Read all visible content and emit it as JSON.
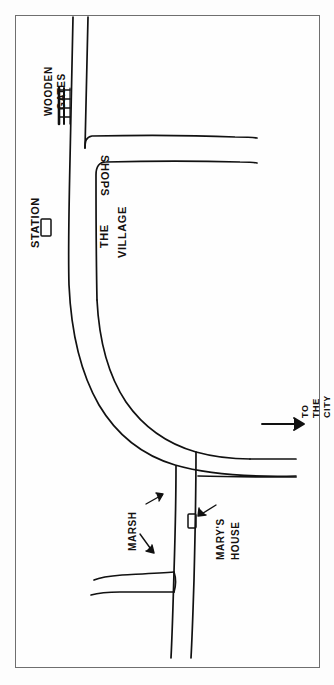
{
  "document": {
    "type": "hand-drawn-sketch-map",
    "title": "Hand-drawn directions map",
    "orientation": "portrait",
    "width": 334,
    "height": 685,
    "paper_color": "#fdfdfd",
    "ink_color": "#111111",
    "frame_color": "#6f6f6f",
    "note": "All text is hand-lettered in capitals and rotated sideways; the sheet reads as a map turned 90 degrees."
  },
  "labels": {
    "wooden_gates": {
      "line1": "WOODEN",
      "line2": "GATES",
      "rotation": "-90",
      "refers_to": "gate-bar across the northern road"
    },
    "station": {
      "text": "STATION",
      "rotation": "-90",
      "refers_to": "small rectangle building west of the road"
    },
    "shops": {
      "text": "SHOPS",
      "rotation": "90",
      "refers_to": "row of shops on the village street"
    },
    "the_village": {
      "line1": "THE",
      "line2": "VILLAGE",
      "rotation": "-90",
      "refers_to": "village area enclosed by the roads"
    },
    "to_the_city": {
      "line1": "TO",
      "line2": "THE",
      "line3": "CITY",
      "rotation": "-90",
      "refers_to": "eastbound road leaving the map, marked with an arrow"
    },
    "marsh": {
      "text": "MARSH",
      "rotation": "-90",
      "arrow_count": 2,
      "refers_to": "boggy ground either side of the southern lane"
    },
    "marys_house": {
      "line1": "MARY'S",
      "line2": "HOUSE",
      "rotation": "-90",
      "arrow_count": 1,
      "refers_to": "small rectangle building beside the southern lane"
    }
  },
  "symbols": {
    "station_building": "rectangle-outline",
    "marys_house_building": "rectangle-outline",
    "gate_bar": "thick-hatched-bar",
    "direction_arrow": "arrow-right",
    "pointer_arrows": "arrow-head-line"
  },
  "map_features": [
    {
      "id": "north-road",
      "name": "North road (to the gates)",
      "kind": "double-line road"
    },
    {
      "id": "village-street",
      "name": "Village street (shops)",
      "kind": "double-line road"
    },
    {
      "id": "main-curve",
      "name": "Main curving road",
      "kind": "double-line road"
    },
    {
      "id": "city-road",
      "name": "Road to the city",
      "kind": "double-line road"
    },
    {
      "id": "south-lane",
      "name": "Southern lane past Mary's house",
      "kind": "double-line road"
    },
    {
      "id": "west-branch",
      "name": "Western side branch",
      "kind": "double-line road"
    }
  ]
}
